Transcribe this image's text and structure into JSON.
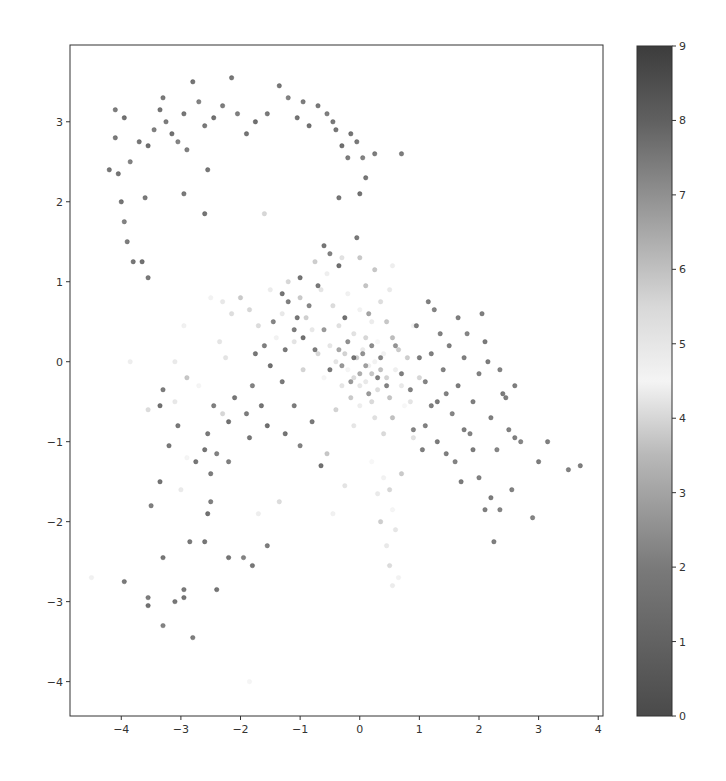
{
  "chart_data": {
    "type": "scatter",
    "title": "",
    "xlabel": "",
    "ylabel": "",
    "xlim": [
      -4.86,
      4.08
    ],
    "ylim": [
      -4.43,
      3.96
    ],
    "grid": false,
    "x_ticks": [
      -4,
      -3,
      -2,
      -1,
      0,
      1,
      2,
      3,
      4
    ],
    "y_ticks": [
      3,
      2,
      1,
      0,
      -1,
      -2,
      -3,
      -4
    ],
    "x_tick_labels": [
      "−4",
      "−3",
      "−2",
      "−1",
      "0",
      "1",
      "2",
      "3",
      "4"
    ],
    "y_tick_labels": [
      "3",
      "2",
      "1",
      "0",
      "−1",
      "−2",
      "−3",
      "−4"
    ],
    "colorbar": {
      "min": 0,
      "max": 9,
      "ticks": [
        0,
        1,
        2,
        3,
        4,
        5,
        6,
        7,
        8,
        9
      ],
      "tick_labels": [
        "0",
        "1",
        "2",
        "3",
        "4",
        "5",
        "6",
        "7",
        "8",
        "9"
      ],
      "colormap": "grayscale-cyclic (dark at 0 and 9, lightest near 4.5)",
      "stops": [
        {
          "v": 0,
          "color": "#4a4a4a"
        },
        {
          "v": 2,
          "color": "#7a7a7a"
        },
        {
          "v": 3.5,
          "color": "#b8b8b8"
        },
        {
          "v": 4.5,
          "color": "#f4f4f4"
        },
        {
          "v": 5.5,
          "color": "#d8d8d8"
        },
        {
          "v": 6.5,
          "color": "#a8a8a8"
        },
        {
          "v": 8,
          "color": "#606060"
        },
        {
          "v": 9,
          "color": "#3c3c3c"
        }
      ]
    },
    "marker": {
      "size": 4,
      "alpha": 0.75
    },
    "clusters": [
      {
        "name": "top-arc",
        "label": 8.5,
        "note": "arc of dark points from (-4.2,2.4) over top (-2..0, 3.0-3.5) down to (0,2.2)"
      },
      {
        "name": "center-dense",
        "label": 4.5,
        "note": "dense mixed cluster centered near (0.1,-0.2)"
      },
      {
        "name": "right-arm",
        "label": 0.5,
        "note": "dark points extending right to (3.7,-1.3)"
      },
      {
        "name": "lower-left",
        "label": 8.5,
        "note": "scattered dark points down to (-3,-3.4)"
      },
      {
        "name": "lower-faint",
        "label": 4.5,
        "note": "faint light points trailing from (0.4,-1.5) to (0.6,-2.8)"
      }
    ],
    "points": [
      [
        -4.2,
        2.4,
        8.6
      ],
      [
        -4.05,
        2.35,
        8.7
      ],
      [
        -4.1,
        3.15,
        8.4
      ],
      [
        -3.95,
        3.05,
        8.8
      ],
      [
        -4.1,
        2.8,
        8.5
      ],
      [
        -3.85,
        2.5,
        8.2
      ],
      [
        -3.7,
        2.75,
        8.6
      ],
      [
        -3.55,
        2.7,
        8.9
      ],
      [
        -3.45,
        2.9,
        8.3
      ],
      [
        -3.35,
        3.15,
        8.7
      ],
      [
        -3.3,
        3.3,
        8.5
      ],
      [
        -3.25,
        3.0,
        8.4
      ],
      [
        -3.15,
        2.85,
        8.8
      ],
      [
        -3.05,
        2.75,
        8.1
      ],
      [
        -2.95,
        3.1,
        8.6
      ],
      [
        -2.8,
        3.5,
        8.7
      ],
      [
        -2.7,
        3.25,
        8.2
      ],
      [
        -2.6,
        2.95,
        8.5
      ],
      [
        -2.45,
        3.05,
        8.8
      ],
      [
        -2.3,
        3.2,
        8.4
      ],
      [
        -2.15,
        3.55,
        8.6
      ],
      [
        -2.05,
        3.1,
        8.3
      ],
      [
        -1.9,
        2.85,
        8.7
      ],
      [
        -1.75,
        3.0,
        8.9
      ],
      [
        -1.55,
        3.1,
        8.5
      ],
      [
        -1.35,
        3.45,
        8.6
      ],
      [
        -1.2,
        3.3,
        8.2
      ],
      [
        -1.05,
        3.05,
        8.7
      ],
      [
        -0.95,
        3.25,
        8.4
      ],
      [
        -0.85,
        2.95,
        8.8
      ],
      [
        -0.7,
        3.2,
        8.5
      ],
      [
        -0.55,
        3.1,
        8.3
      ],
      [
        -0.4,
        2.9,
        8.6
      ],
      [
        -0.3,
        2.7,
        8.9
      ],
      [
        -0.2,
        2.55,
        8.4
      ],
      [
        -0.15,
        2.85,
        8.7
      ],
      [
        -0.05,
        2.75,
        8.5
      ],
      [
        0.05,
        2.55,
        8.2
      ],
      [
        0.1,
        2.3,
        8.6
      ],
      [
        0.0,
        2.1,
        8.8
      ],
      [
        0.25,
        2.6,
        8.4
      ],
      [
        -0.45,
        3.0,
        8.5
      ],
      [
        -2.55,
        2.4,
        8.6
      ],
      [
        -2.9,
        2.65,
        8.3
      ],
      [
        -3.6,
        2.05,
        8.5
      ],
      [
        -4.0,
        2.0,
        8.7
      ],
      [
        -3.9,
        1.5,
        8.4
      ],
      [
        -3.8,
        1.25,
        8.6
      ],
      [
        -3.55,
        1.05,
        8.5
      ],
      [
        -3.65,
        1.25,
        8.8
      ],
      [
        -3.95,
        1.75,
        8.2
      ],
      [
        -2.95,
        2.1,
        8.5
      ],
      [
        -2.6,
        1.85,
        8.7
      ],
      [
        -1.6,
        1.85,
        5.8
      ],
      [
        0.7,
        2.6,
        8.4
      ],
      [
        -0.35,
        2.05,
        8.6
      ],
      [
        -0.05,
        1.55,
        8.5
      ],
      [
        -0.2,
        -0.1,
        4.6
      ],
      [
        -0.1,
        -0.2,
        3.9
      ],
      [
        0.0,
        -0.3,
        5.2
      ],
      [
        0.1,
        -0.25,
        4.2
      ],
      [
        0.2,
        -0.15,
        3.4
      ],
      [
        0.3,
        -0.35,
        5.6
      ],
      [
        0.15,
        -0.05,
        4.8
      ],
      [
        -0.05,
        0.05,
        3.6
      ],
      [
        0.05,
        0.15,
        5.1
      ],
      [
        0.25,
        0.0,
        4.4
      ],
      [
        0.35,
        -0.1,
        3.2
      ],
      [
        0.45,
        -0.2,
        5.9
      ],
      [
        -0.3,
        -0.3,
        4.1
      ],
      [
        -0.25,
        0.1,
        3.7
      ],
      [
        -0.4,
        0.0,
        5.4
      ],
      [
        0.4,
        0.1,
        4.7
      ],
      [
        0.5,
        -0.45,
        3.3
      ],
      [
        0.2,
        -0.5,
        5.7
      ],
      [
        0.0,
        -0.55,
        4.3
      ],
      [
        -0.15,
        -0.45,
        3.5
      ],
      [
        0.6,
        -0.1,
        4.9
      ],
      [
        -0.5,
        0.2,
        5.3
      ],
      [
        0.1,
        0.3,
        3.8
      ],
      [
        0.3,
        0.25,
        4.5
      ],
      [
        -0.1,
        0.35,
        5.5
      ],
      [
        0.55,
        0.3,
        3.1
      ],
      [
        0.65,
        0.15,
        6.1
      ],
      [
        -0.35,
        0.45,
        4.0
      ],
      [
        0.2,
        0.5,
        5.0
      ],
      [
        0.45,
        0.5,
        3.4
      ],
      [
        -0.6,
        -0.2,
        4.6
      ],
      [
        -0.7,
        0.1,
        5.8
      ],
      [
        0.7,
        -0.3,
        4.2
      ],
      [
        0.8,
        0.05,
        3.6
      ],
      [
        -0.8,
        0.4,
        5.2
      ],
      [
        0.0,
        0.65,
        4.4
      ],
      [
        -0.45,
        0.7,
        3.9
      ],
      [
        0.35,
        0.75,
        5.6
      ],
      [
        -0.2,
        0.85,
        4.8
      ],
      [
        0.1,
        0.95,
        3.3
      ],
      [
        0.5,
        0.9,
        5.1
      ],
      [
        -0.65,
        0.9,
        4.1
      ],
      [
        -0.9,
        0.55,
        6.0
      ],
      [
        -1.0,
        0.8,
        3.5
      ],
      [
        -1.1,
        0.25,
        5.4
      ],
      [
        0.9,
        0.45,
        4.7
      ],
      [
        1.0,
        -0.2,
        3.8
      ],
      [
        -0.95,
        -0.1,
        5.9
      ],
      [
        0.25,
        -0.7,
        4.0
      ],
      [
        0.55,
        -0.7,
        3.2
      ],
      [
        -0.1,
        -0.8,
        5.3
      ],
      [
        0.75,
        -0.55,
        4.5
      ],
      [
        -0.4,
        -0.6,
        3.7
      ],
      [
        0.4,
        -0.9,
        5.7
      ],
      [
        -0.55,
        1.1,
        4.9
      ],
      [
        0.25,
        1.15,
        3.4
      ],
      [
        -0.3,
        1.3,
        5.5
      ],
      [
        0.55,
        1.2,
        4.3
      ],
      [
        -0.75,
        1.25,
        3.6
      ],
      [
        0.0,
        1.3,
        6.2
      ],
      [
        -1.3,
        0.6,
        4.2
      ],
      [
        -1.5,
        0.9,
        5.0
      ],
      [
        -1.7,
        0.45,
        3.9
      ],
      [
        -1.2,
        1.0,
        5.8
      ],
      [
        -1.4,
        0.3,
        4.4
      ],
      [
        -2.0,
        0.8,
        3.5
      ],
      [
        -2.3,
        0.75,
        5.2
      ],
      [
        -2.5,
        0.8,
        4.7
      ],
      [
        -1.85,
        0.65,
        3.8
      ],
      [
        -2.15,
        0.6,
        5.6
      ],
      [
        -2.35,
        0.25,
        4.1
      ],
      [
        -2.25,
        0.05,
        5.4
      ],
      [
        -2.7,
        -0.3,
        4.6
      ],
      [
        -2.9,
        -0.2,
        3.4
      ],
      [
        -3.1,
        0.0,
        5.1
      ],
      [
        -3.85,
        0.0,
        4.3
      ],
      [
        -3.55,
        -0.6,
        3.9
      ],
      [
        -2.95,
        0.45,
        4.8
      ],
      [
        -0.3,
        -0.05,
        1.8
      ],
      [
        -0.1,
        0.05,
        8.6
      ],
      [
        0.1,
        -0.05,
        2.2
      ],
      [
        0.2,
        0.2,
        7.9
      ],
      [
        -0.2,
        0.25,
        1.4
      ],
      [
        0.3,
        -0.2,
        8.3
      ],
      [
        0.0,
        -0.15,
        2.6
      ],
      [
        -0.15,
        -0.25,
        7.5
      ],
      [
        0.15,
        -0.4,
        1.9
      ],
      [
        0.35,
        0.05,
        8.1
      ],
      [
        -0.35,
        0.15,
        2.4
      ],
      [
        0.05,
        0.1,
        7.7
      ],
      [
        -0.5,
        -0.1,
        8.5
      ],
      [
        -0.6,
        0.4,
        2.0
      ],
      [
        0.45,
        -0.3,
        8.2
      ],
      [
        0.6,
        0.2,
        1.6
      ],
      [
        -0.25,
        0.55,
        8.8
      ],
      [
        0.15,
        0.6,
        2.3
      ],
      [
        -0.75,
        0.15,
        8.4
      ],
      [
        -0.85,
        0.7,
        8.0
      ],
      [
        -1.05,
        0.55,
        8.6
      ],
      [
        -1.2,
        0.75,
        8.3
      ],
      [
        -1.0,
        1.05,
        8.7
      ],
      [
        -0.7,
        0.95,
        8.5
      ],
      [
        -0.5,
        1.35,
        8.2
      ],
      [
        -0.35,
        1.2,
        8.9
      ],
      [
        -0.6,
        1.45,
        8.6
      ],
      [
        -1.1,
        0.4,
        8.4
      ],
      [
        -1.3,
        0.85,
        8.7
      ],
      [
        -1.45,
        0.5,
        8.1
      ],
      [
        -0.95,
        0.3,
        8.8
      ],
      [
        -1.25,
        0.15,
        8.5
      ],
      [
        -1.6,
        0.2,
        8.3
      ],
      [
        -1.75,
        0.1,
        8.6
      ],
      [
        -1.5,
        -0.05,
        8.9
      ],
      [
        -1.8,
        -0.3,
        8.2
      ],
      [
        -1.3,
        -0.25,
        8.5
      ],
      [
        -1.65,
        -0.55,
        8.7
      ],
      [
        -1.9,
        -0.65,
        8.4
      ],
      [
        -2.1,
        -0.45,
        8.6
      ],
      [
        -2.2,
        -0.75,
        8.8
      ],
      [
        -2.45,
        -0.55,
        8.3
      ],
      [
        -2.55,
        -0.9,
        8.5
      ],
      [
        -2.6,
        -1.1,
        8.7
      ],
      [
        -2.4,
        -1.15,
        8.2
      ],
      [
        -2.75,
        -1.25,
        8.6
      ],
      [
        -3.3,
        -0.35,
        8.4
      ],
      [
        -3.35,
        -0.55,
        8.8
      ],
      [
        -3.05,
        -0.8,
        8.5
      ],
      [
        -2.2,
        -1.25,
        8.3
      ],
      [
        -1.85,
        -0.95,
        8.6
      ],
      [
        -1.55,
        -0.8,
        8.9
      ],
      [
        -1.1,
        -0.55,
        8.4
      ],
      [
        -1.25,
        -0.9,
        8.7
      ],
      [
        -1.0,
        -1.05,
        8.2
      ],
      [
        -0.8,
        -0.75,
        8.5
      ],
      [
        -0.65,
        -1.3,
        8.8
      ],
      [
        0.7,
        -0.15,
        0.4
      ],
      [
        0.85,
        -0.35,
        0.6
      ],
      [
        1.0,
        0.05,
        0.3
      ],
      [
        1.1,
        -0.25,
        0.7
      ],
      [
        1.2,
        0.1,
        0.5
      ],
      [
        1.3,
        -0.5,
        0.2
      ],
      [
        1.4,
        -0.1,
        0.6
      ],
      [
        1.5,
        0.2,
        0.4
      ],
      [
        1.55,
        -0.65,
        0.8
      ],
      [
        1.65,
        -0.3,
        0.3
      ],
      [
        1.75,
        0.05,
        0.5
      ],
      [
        1.85,
        -0.9,
        0.7
      ],
      [
        1.9,
        -0.5,
        0.4
      ],
      [
        2.0,
        -0.15,
        0.6
      ],
      [
        2.1,
        0.25,
        0.2
      ],
      [
        2.2,
        -0.7,
        0.5
      ],
      [
        2.3,
        -1.1,
        0.8
      ],
      [
        2.4,
        -0.4,
        0.3
      ],
      [
        2.5,
        -0.85,
        0.6
      ],
      [
        2.6,
        -0.3,
        0.4
      ],
      [
        1.15,
        0.75,
        0.5
      ],
      [
        1.25,
        0.65,
        0.7
      ],
      [
        0.95,
        0.45,
        0.3
      ],
      [
        1.35,
        0.35,
        0.6
      ],
      [
        1.65,
        0.55,
        0.4
      ],
      [
        1.8,
        0.35,
        0.8
      ],
      [
        2.05,
        0.6,
        0.5
      ],
      [
        2.15,
        0.0,
        0.3
      ],
      [
        2.35,
        -0.1,
        0.7
      ],
      [
        2.45,
        -0.45,
        0.4
      ],
      [
        1.1,
        -0.8,
        0.6
      ],
      [
        1.3,
        -1.0,
        0.2
      ],
      [
        1.45,
        -1.15,
        0.5
      ],
      [
        1.6,
        -1.25,
        0.7
      ],
      [
        1.75,
        -0.85,
        0.4
      ],
      [
        2.0,
        -1.45,
        0.6
      ],
      [
        2.2,
        -1.7,
        0.3
      ],
      [
        2.35,
        -1.85,
        0.8
      ],
      [
        2.1,
        -1.85,
        0.5
      ],
      [
        2.25,
        -2.25,
        0.4
      ],
      [
        2.55,
        -1.6,
        0.6
      ],
      [
        2.9,
        -1.95,
        0.7
      ],
      [
        3.0,
        -1.25,
        0.3
      ],
      [
        3.15,
        -1.0,
        0.5
      ],
      [
        3.5,
        -1.35,
        0.6
      ],
      [
        3.7,
        -1.3,
        0.4
      ],
      [
        2.7,
        -1.0,
        0.8
      ],
      [
        1.9,
        -1.1,
        0.3
      ],
      [
        1.2,
        -0.55,
        0.5
      ],
      [
        0.9,
        -0.85,
        0.7
      ],
      [
        1.05,
        -1.1,
        0.4
      ],
      [
        1.45,
        -0.4,
        0.6
      ],
      [
        1.7,
        -1.5,
        0.2
      ],
      [
        2.6,
        -0.95,
        0.5
      ],
      [
        -3.2,
        -1.05,
        8.5
      ],
      [
        -3.35,
        -1.5,
        8.7
      ],
      [
        -3.5,
        -1.8,
        8.3
      ],
      [
        -3.0,
        -1.6,
        5.1
      ],
      [
        -3.3,
        -2.45,
        8.6
      ],
      [
        -3.55,
        -2.95,
        8.4
      ],
      [
        -3.55,
        -3.05,
        8.8
      ],
      [
        -3.3,
        -3.3,
        8.2
      ],
      [
        -2.95,
        -2.85,
        8.5
      ],
      [
        -2.95,
        -2.95,
        8.7
      ],
      [
        -3.1,
        -3.0,
        8.6
      ],
      [
        -2.8,
        -3.45,
        8.4
      ],
      [
        -2.55,
        -1.9,
        8.8
      ],
      [
        -2.5,
        -1.75,
        8.3
      ],
      [
        -2.6,
        -2.25,
        8.6
      ],
      [
        -2.85,
        -2.25,
        8.5
      ],
      [
        -2.4,
        -2.85,
        8.7
      ],
      [
        -1.95,
        -2.45,
        8.2
      ],
      [
        -1.8,
        -2.55,
        8.6
      ],
      [
        -1.55,
        -2.3,
        8.4
      ],
      [
        -4.5,
        -2.7,
        4.8
      ],
      [
        -3.95,
        -2.75,
        8.5
      ],
      [
        -2.2,
        -2.45,
        8.7
      ],
      [
        -2.5,
        -1.4,
        8.4
      ],
      [
        -2.3,
        -0.65,
        3.8
      ],
      [
        -2.9,
        -1.2,
        4.6
      ],
      [
        -3.1,
        -0.5,
        5.2
      ],
      [
        -1.7,
        -1.9,
        4.3
      ],
      [
        -1.35,
        -1.75,
        3.9
      ],
      [
        0.4,
        -1.45,
        4.4
      ],
      [
        0.5,
        -1.6,
        3.8
      ],
      [
        0.3,
        -1.65,
        5.1
      ],
      [
        0.55,
        -1.85,
        4.6
      ],
      [
        0.35,
        -2.0,
        3.6
      ],
      [
        0.6,
        -2.1,
        5.3
      ],
      [
        0.45,
        -2.3,
        4.2
      ],
      [
        0.5,
        -2.55,
        3.9
      ],
      [
        0.65,
        -2.7,
        4.7
      ],
      [
        0.55,
        -2.8,
        5.0
      ],
      [
        0.2,
        -1.25,
        4.5
      ],
      [
        0.7,
        -1.4,
        3.5
      ],
      [
        -0.45,
        -1.9,
        4.8
      ],
      [
        -0.25,
        -1.55,
        5.4
      ],
      [
        -1.85,
        -4.0,
        4.6
      ],
      [
        0.85,
        -0.5,
        4.1
      ],
      [
        0.9,
        -0.95,
        5.5
      ],
      [
        -0.55,
        -1.15,
        3.4
      ]
    ]
  }
}
